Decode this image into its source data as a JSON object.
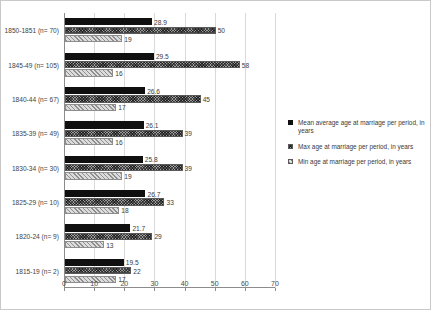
{
  "chart_data": {
    "type": "bar",
    "orientation": "horizontal",
    "title": "",
    "xlabel": "",
    "ylabel": "",
    "xlim": [
      0,
      70
    ],
    "xticks": [
      0,
      10,
      20,
      30,
      40,
      50,
      60,
      70
    ],
    "grid": true,
    "legend_position": "right",
    "categories": [
      "1850-1851 (n= 70)",
      "1845-49 (n= 105)",
      "1840-44 (n= 67)",
      "1835-39 (n= 49)",
      "1830-34 (n= 30)",
      "1825-29 (n= 10)",
      "1820-24 (n= 9)",
      "1815-19 (n= 2)"
    ],
    "series": [
      {
        "name": "Mean average age at marriage per period, in years",
        "key": "mean",
        "values": [
          28.9,
          29.5,
          26.6,
          26.1,
          25.8,
          26.7,
          21.7,
          19.5
        ],
        "labels": [
          "28.9",
          "29.5",
          "26.6",
          "26.1",
          "25.8",
          "26.7",
          "21.7",
          "19.5"
        ]
      },
      {
        "name": "Max age at marriage per period, in years",
        "key": "max",
        "values": [
          50,
          58,
          45,
          39,
          39,
          33,
          29,
          22
        ],
        "labels": [
          "50",
          "58",
          "45",
          "39",
          "39",
          "33",
          "29",
          "22"
        ]
      },
      {
        "name": "Min age at marriage per period, in years",
        "key": "min",
        "values": [
          19,
          16,
          17,
          16,
          19,
          18,
          13,
          17
        ],
        "labels": [
          "19",
          "16",
          "17",
          "16",
          "19",
          "18",
          "13",
          "17"
        ]
      }
    ]
  },
  "colors": {
    "mean": "#101010",
    "max": "#9a9a9a",
    "min": "#dcdcdc",
    "axis": "#8c8c8c",
    "grid": "#d9d9d9",
    "text": "#3a3a3a",
    "border": "#c9c9c9"
  }
}
